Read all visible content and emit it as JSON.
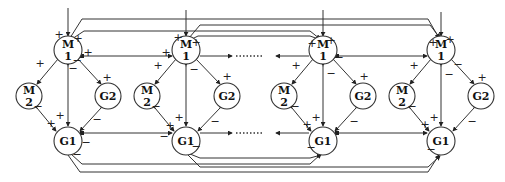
{
  "diagram": {
    "type": "coupled-module-network",
    "modules": [
      {
        "id": "m1",
        "cx": 68,
        "nodes": {
          "M1": {
            "line1": "M",
            "line2": "1"
          },
          "M2": {
            "line1": "M",
            "line2": "2"
          },
          "G2": {
            "label": "G2"
          },
          "G1": {
            "label": "G1"
          }
        }
      },
      {
        "id": "m2",
        "cx": 186,
        "nodes": {
          "M1": {
            "line1": "M",
            "line2": "1"
          },
          "M2": {
            "line1": "M",
            "line2": "2"
          },
          "G2": {
            "label": "G2"
          },
          "G1": {
            "label": "G1"
          }
        }
      },
      {
        "id": "m3",
        "cx": 323,
        "nodes": {
          "M1": {
            "line1": "M",
            "line2": "1"
          },
          "M2": {
            "line1": "M",
            "line2": "2"
          },
          "G2": {
            "label": "G2"
          },
          "G1": {
            "label": "G1"
          }
        }
      },
      {
        "id": "m4",
        "cx": 441,
        "nodes": {
          "M1": {
            "line1": "M",
            "line2": "1"
          },
          "M2": {
            "line1": "M",
            "line2": "2"
          },
          "G2": {
            "label": "G2"
          },
          "G1": {
            "label": "G1"
          }
        }
      }
    ],
    "signs": {
      "plus": "+",
      "minus": "−"
    },
    "ellipsis": "........"
  }
}
